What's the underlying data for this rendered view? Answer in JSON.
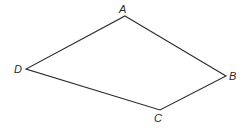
{
  "figure": {
    "type": "quadrilateral",
    "stroke_color": "#2a2a2a",
    "background": "#ffffff",
    "vertices": [
      {
        "name": "A",
        "x": 125,
        "y": 16,
        "label_x": 119,
        "label_y": 13
      },
      {
        "name": "B",
        "x": 226,
        "y": 76,
        "label_x": 229,
        "label_y": 80
      },
      {
        "name": "C",
        "x": 160,
        "y": 110,
        "label_x": 154,
        "label_y": 122
      },
      {
        "name": "D",
        "x": 26,
        "y": 69,
        "label_x": 14,
        "label_y": 73
      }
    ],
    "edges": [
      {
        "from": "A",
        "to": "B"
      },
      {
        "from": "B",
        "to": "C"
      },
      {
        "from": "C",
        "to": "D"
      },
      {
        "from": "D",
        "to": "A"
      }
    ]
  }
}
